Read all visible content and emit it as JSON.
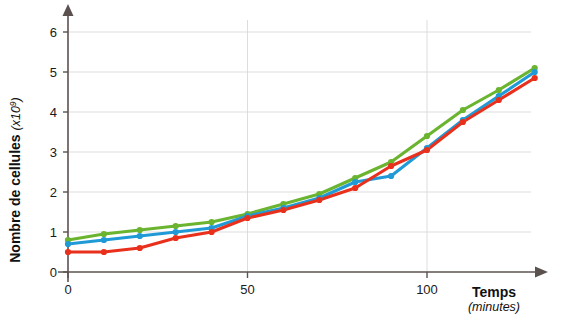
{
  "chart_data": {
    "type": "line",
    "title": "",
    "xlabel": "Temps",
    "xlabel_unit": "(minutes)",
    "ylabel": "Nombre de cellules",
    "ylabel_unit": "(x10",
    "ylabel_exponent": "9",
    "ylabel_unit_close": ")",
    "xlim": [
      0,
      135
    ],
    "ylim": [
      0,
      6.5
    ],
    "grid": true,
    "legend": "none",
    "x_ticks": [
      0,
      50,
      100
    ],
    "x_tick_labels": [
      "0",
      "50",
      "100"
    ],
    "y_ticks": [
      0,
      1,
      2,
      3,
      4,
      5,
      6
    ],
    "y_tick_labels": [
      "0",
      "1",
      "2",
      "3",
      "4",
      "5",
      "6"
    ],
    "x": [
      0,
      10,
      20,
      30,
      40,
      50,
      60,
      70,
      80,
      90,
      100,
      110,
      120,
      130
    ],
    "series": [
      {
        "name": "green",
        "color": "#6ab42f",
        "values": [
          0.8,
          0.95,
          1.05,
          1.15,
          1.25,
          1.45,
          1.7,
          1.95,
          2.35,
          2.75,
          3.4,
          4.05,
          4.55,
          5.1
        ]
      },
      {
        "name": "blue",
        "color": "#1f9ad6",
        "values": [
          0.7,
          0.8,
          0.9,
          1.0,
          1.1,
          1.4,
          1.6,
          1.85,
          2.25,
          2.4,
          3.1,
          3.8,
          4.4,
          5.0
        ]
      },
      {
        "name": "red",
        "color": "#e8301c",
        "values": [
          0.5,
          0.5,
          0.6,
          0.85,
          1.0,
          1.35,
          1.55,
          1.8,
          2.1,
          2.65,
          3.05,
          3.75,
          4.3,
          4.85
        ]
      }
    ]
  },
  "colors": {
    "axis": "#5b5250",
    "grid": "#d9d9d9",
    "background": "#ffffff"
  }
}
